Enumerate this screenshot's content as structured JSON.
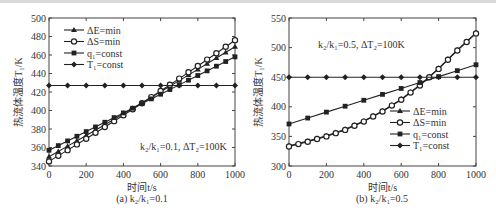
{
  "chart_data": [
    {
      "type": "line",
      "panel": "a",
      "caption": "(a) k₂/k₁=0.1",
      "annotation": "k₂/k₁=0.1, ΔT₂=100K",
      "xlabel": "时间t/s",
      "ylabel": "热流体温度T₁/K",
      "xlim": [
        0,
        1000
      ],
      "ylim": [
        340,
        500
      ],
      "xticks": [
        0,
        200,
        400,
        600,
        800,
        1000
      ],
      "yticks": [
        340,
        360,
        380,
        400,
        420,
        440,
        460,
        480,
        500
      ],
      "legend_position": "upper left",
      "x": [
        0,
        100,
        200,
        300,
        400,
        500,
        600,
        700,
        800,
        900,
        1000
      ],
      "series": [
        {
          "name": "ΔE=min",
          "marker": "triangle",
          "values": [
            350.0,
            358.5,
            367.0,
            375.7,
            384.5,
            393.5,
            402.6,
            411.9,
            421.4,
            431.1,
            441.0
          ]
        },
        {
          "name": "ΔS=min",
          "marker": "circle",
          "values": [
            345.0,
            353.5,
            362.2,
            371.2,
            380.5,
            390.0,
            399.8,
            409.9,
            420.3,
            431.0,
            442.0
          ]
        },
        {
          "name": "q₁=const",
          "marker": "square",
          "values": [
            357.0,
            366.0,
            375.0,
            384.0,
            393.0,
            402.0,
            411.0,
            420.0,
            429.0,
            438.0,
            447.0
          ]
        },
        {
          "name": "T₁=const",
          "marker": "diamond",
          "values": [
            427,
            427,
            427,
            427,
            427,
            427,
            427,
            427,
            427,
            427,
            427
          ]
        }
      ],
      "series_display_note": "displayed lines extend to t=1000 with endpoints: ΔE=min 469, ΔS=min 476, q₁=const 458, T₁=const 427"
    },
    {
      "type": "line",
      "panel": "b",
      "caption": "(b) k₂/k₁=0.5",
      "annotation": "k₂/k₁=0.5, ΔT₂=100K",
      "xlabel": "时间t/s",
      "ylabel": "热流体温度T₁/K",
      "xlim": [
        0,
        1000
      ],
      "ylim": [
        300,
        550
      ],
      "xticks": [
        0,
        200,
        400,
        600,
        800,
        1000
      ],
      "yticks": [
        300,
        350,
        400,
        450,
        500,
        550
      ],
      "legend_position": "lower right",
      "x": [
        0,
        100,
        200,
        300,
        400,
        500,
        600,
        700,
        800,
        900,
        1000
      ],
      "series": [
        {
          "name": "ΔE=min",
          "marker": "triangle",
          "values": [
            334,
            342,
            351,
            362,
            376,
            393,
            413,
            437,
            465,
            496,
            525
          ]
        },
        {
          "name": "ΔS=min",
          "marker": "circle",
          "values": [
            333,
            341,
            350,
            361,
            375,
            392,
            412,
            436,
            464,
            495,
            524
          ]
        },
        {
          "name": "q₁=const",
          "marker": "square",
          "values": [
            371,
            381,
            391,
            401,
            411,
            421,
            431,
            441,
            451,
            461,
            471
          ]
        },
        {
          "name": "T₁=const",
          "marker": "diamond",
          "values": [
            450,
            450,
            450,
            450,
            450,
            450,
            450,
            450,
            450,
            450,
            450
          ]
        }
      ]
    }
  ],
  "legend_a": [
    "ΔE=min",
    "ΔS=min",
    "q₁=const",
    "T₁=const"
  ],
  "legend_b": [
    "ΔE=min",
    "ΔS=min",
    "q₁=const",
    "T₁=const"
  ]
}
